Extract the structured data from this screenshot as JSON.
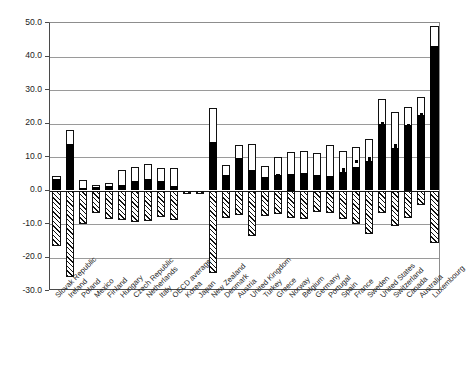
{
  "chart_data": {
    "type": "bar",
    "title": "",
    "subtitle": "",
    "xlabel": "",
    "ylabel": "",
    "ylim": [
      -30.0,
      50.0
    ],
    "grid": true,
    "legend_position": "none",
    "ytick_labels": [
      "50.0",
      "40.0",
      "30.0",
      "20.0",
      "10.0",
      "0.0",
      "-10.0",
      "-20.0",
      "-30.0"
    ],
    "ytick_values": [
      50,
      40,
      30,
      20,
      10,
      0,
      -10,
      -20,
      -30
    ],
    "categories": [
      "Slovak Republic",
      "Ireland",
      "Poland",
      "Mexico",
      "Finland",
      "Hungary",
      "Czech Republic",
      "Netherlands",
      "Italy",
      "OECD average",
      "Korea",
      "Japan",
      "New Zealand",
      "Denmark",
      "Austria",
      "United Kingdom",
      "Turkey",
      "Greece",
      "Norway",
      "Belgium",
      "Germany",
      "Portugal",
      "Spain",
      "France",
      "Sweden",
      "United States",
      "Switzerland",
      "Canada",
      "Australia",
      "Luxembourg"
    ],
    "series": [
      {
        "name": "lower segment (solid black)",
        "style": "solid-black",
        "values": [
          3.4,
          14.0,
          0.6,
          1.0,
          1.2,
          1.5,
          2.7,
          3.4,
          2.9,
          1.2,
          -0.6,
          -0.5,
          14.4,
          4.7,
          9.7,
          6.2,
          3.9,
          4.5,
          5.0,
          5.1,
          4.7,
          4.2,
          5.5,
          6.9,
          8.9,
          19.8,
          12.6,
          19.5,
          22.4,
          43.2
        ]
      },
      {
        "name": "upper segment (hollow white)",
        "style": "hollow-white",
        "values": [
          4.3,
          18.0,
          3.0,
          1.7,
          2.3,
          6.1,
          7.0,
          7.9,
          6.7,
          6.7,
          -1.0,
          -0.9,
          24.6,
          7.6,
          13.5,
          13.9,
          7.2,
          9.9,
          11.4,
          11.7,
          11.3,
          13.5,
          11.7,
          13.1,
          15.4,
          27.3,
          23.3,
          25.0,
          28.0,
          49.0
        ]
      },
      {
        "name": "negative (hatched)",
        "style": "hatched",
        "values": [
          -16.5,
          -25.8,
          -10.0,
          -6.8,
          -8.5,
          -8.7,
          -9.3,
          -9.2,
          -7.8,
          -8.9,
          -1.0,
          -0.9,
          -24.6,
          -8.1,
          -7.2,
          -13.6,
          -7.7,
          -7.0,
          -8.2,
          -8.4,
          -6.3,
          -6.6,
          -8.5,
          -9.9,
          -13.0,
          -6.8,
          -10.7,
          -8.2,
          -4.3,
          -15.6
        ]
      }
    ],
    "markers": {
      "name": "point marker",
      "values": [
        null,
        null,
        null,
        null,
        null,
        null,
        null,
        null,
        null,
        null,
        null,
        null,
        null,
        null,
        null,
        null,
        null,
        4.3,
        null,
        null,
        4.0,
        null,
        6.1,
        8.6,
        9.4,
        19.9,
        13.3,
        19.4,
        22.8,
        null
      ]
    },
    "colors": {
      "black": "#000000",
      "white": "#ffffff",
      "outline": "#111111",
      "gridline": "#9a9a9a",
      "axis": "#4a4a4a"
    }
  }
}
